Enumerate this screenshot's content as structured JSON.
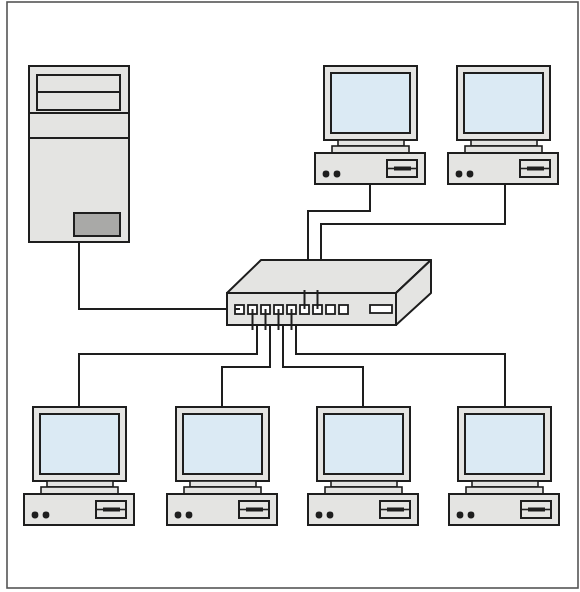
{
  "diagram": {
    "title": "Star network topology",
    "colors": {
      "stroke": "#1e1e1e",
      "case_fill": "#e4e4e2",
      "screen_fill": "#dbeaf4",
      "button_fill": "#a9a9a7",
      "frame": "#555555",
      "background": "#ffffff"
    },
    "frame": {
      "x": 7,
      "y": 2,
      "w": 571,
      "h": 586
    },
    "server": {
      "label": "Server",
      "x": 29,
      "y": 66,
      "w": 100,
      "h": 176
    },
    "switch": {
      "label": "Network switch",
      "port_count": 9
    },
    "workstations": [
      {
        "label": "Workstation 1",
        "x": 324,
        "y": 66,
        "position": "top"
      },
      {
        "label": "Workstation 2",
        "x": 457,
        "y": 66,
        "position": "top"
      },
      {
        "label": "Workstation 3",
        "x": 33,
        "y": 407,
        "position": "bottom"
      },
      {
        "label": "Workstation 4",
        "x": 176,
        "y": 407,
        "position": "bottom"
      },
      {
        "label": "Workstation 5",
        "x": 317,
        "y": 407,
        "position": "bottom"
      },
      {
        "label": "Workstation 6",
        "x": 458,
        "y": 407,
        "position": "bottom"
      }
    ],
    "cables": [
      {
        "from": "Server",
        "to": "Switch port 1"
      },
      {
        "from": "Switch port 2",
        "to": "Workstation 3"
      },
      {
        "from": "Switch port 3",
        "to": "Workstation 4"
      },
      {
        "from": "Switch port 4",
        "to": "Workstation 5"
      },
      {
        "from": "Switch port 5",
        "to": "Workstation 6"
      },
      {
        "from": "Switch port 6",
        "to": "Workstation 1"
      },
      {
        "from": "Switch port 7",
        "to": "Workstation 2"
      }
    ]
  }
}
